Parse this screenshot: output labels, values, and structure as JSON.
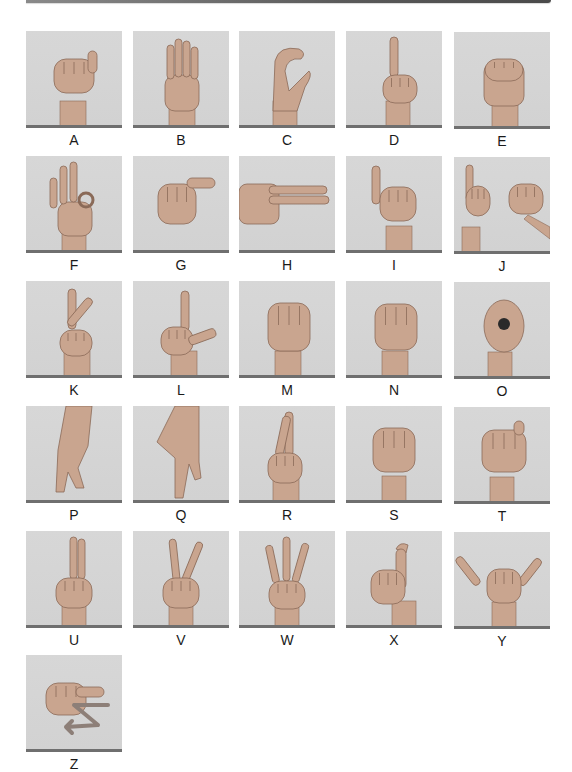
{
  "page": {
    "type": "fingerspelling-alphabet-chart",
    "colors": {
      "tile_background": "#d4d4d4",
      "tile_bar": "#6f6f6f",
      "label_text": "#1a1a1a",
      "skin": "#c9a58f",
      "skin_shadow": "#8a6a58",
      "z_arrow": "#8d7f78"
    }
  },
  "signs": [
    {
      "letter": "A",
      "hand": "fist-thumb-side"
    },
    {
      "letter": "B",
      "hand": "flat-fingers-up-thumb-across"
    },
    {
      "letter": "C",
      "hand": "curved-c-shape"
    },
    {
      "letter": "D",
      "hand": "index-up-others-circle"
    },
    {
      "letter": "E",
      "hand": "fingers-curled-over-thumb"
    },
    {
      "letter": "F",
      "hand": "ok-three-fingers-up"
    },
    {
      "letter": "G",
      "hand": "index-thumb-pointing-side"
    },
    {
      "letter": "H",
      "hand": "two-fingers-pointing-side"
    },
    {
      "letter": "I",
      "hand": "pinky-up"
    },
    {
      "letter": "J",
      "hand": "pinky-up-twist-motion"
    },
    {
      "letter": "K",
      "hand": "index-middle-up-thumb-between"
    },
    {
      "letter": "L",
      "hand": "index-up-thumb-out"
    },
    {
      "letter": "M",
      "hand": "three-fingers-over-thumb"
    },
    {
      "letter": "N",
      "hand": "two-fingers-over-thumb"
    },
    {
      "letter": "O",
      "hand": "fingers-touch-thumb-circle"
    },
    {
      "letter": "P",
      "hand": "k-pointing-down"
    },
    {
      "letter": "Q",
      "hand": "g-pointing-down"
    },
    {
      "letter": "R",
      "hand": "crossed-fingers"
    },
    {
      "letter": "S",
      "hand": "fist-thumb-front"
    },
    {
      "letter": "T",
      "hand": "thumb-between-index-middle"
    },
    {
      "letter": "U",
      "hand": "two-fingers-together-up"
    },
    {
      "letter": "V",
      "hand": "two-fingers-spread-up"
    },
    {
      "letter": "W",
      "hand": "three-fingers-spread-up"
    },
    {
      "letter": "X",
      "hand": "index-hooked"
    },
    {
      "letter": "Y",
      "hand": "thumb-pinky-out"
    },
    {
      "letter": "Z",
      "hand": "index-trace-z-motion"
    }
  ]
}
